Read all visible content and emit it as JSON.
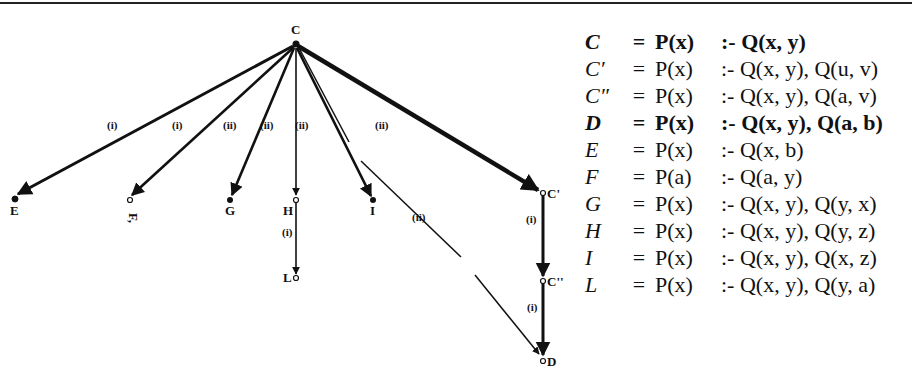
{
  "graph": {
    "root": {
      "id": "C",
      "label": "C",
      "x": 295,
      "y": 45
    },
    "nodes": [
      {
        "id": "E",
        "label": "E",
        "x": 15,
        "y": 199
      },
      {
        "id": "F",
        "label": "F,",
        "x": 130,
        "y": 200
      },
      {
        "id": "G",
        "label": "G",
        "x": 230,
        "y": 200
      },
      {
        "id": "H",
        "label": "H",
        "x": 296,
        "y": 200
      },
      {
        "id": "I",
        "label": "I",
        "x": 373,
        "y": 200
      },
      {
        "id": "L",
        "label": "L",
        "x": 296,
        "y": 278
      },
      {
        "id": "C1",
        "label": "C'",
        "x": 543,
        "y": 193
      },
      {
        "id": "C2",
        "label": "C''",
        "x": 543,
        "y": 281
      },
      {
        "id": "D",
        "label": "D",
        "x": 543,
        "y": 360
      }
    ],
    "edges": [
      {
        "from": "C",
        "to": "E",
        "label": "(i)"
      },
      {
        "from": "C",
        "to": "F",
        "label": "(i)"
      },
      {
        "from": "C",
        "to": "G",
        "label": "(ii)"
      },
      {
        "from": "C",
        "to": "H",
        "label": "(ii)"
      },
      {
        "from": "C",
        "to": "I",
        "label": "(ii)"
      },
      {
        "from": "C",
        "to": "C1",
        "label": "(ii)"
      },
      {
        "from": "C",
        "to": "D",
        "label": "(ii)"
      },
      {
        "from": "H",
        "to": "L",
        "label": "(i)"
      },
      {
        "from": "C1",
        "to": "C2",
        "label": "(i)"
      },
      {
        "from": "C2",
        "to": "D",
        "label": "(i)"
      }
    ]
  },
  "definitions": [
    {
      "name": "C",
      "eq": "=",
      "head": "P(x)",
      "body": ":- Q(x, y)",
      "bold": true
    },
    {
      "name": "C′",
      "eq": "=",
      "head": "P(x)",
      "body": ":- Q(x, y), Q(u, v)",
      "bold": false
    },
    {
      "name": "C″",
      "eq": "=",
      "head": "P(x)",
      "body": ":- Q(x, y), Q(a, v)",
      "bold": false
    },
    {
      "name": "D",
      "eq": "=",
      "head": "P(x)",
      "body": ":- Q(x, y), Q(a, b)",
      "bold": true
    },
    {
      "name": "E",
      "eq": "=",
      "head": "P(x)",
      "body": ":- Q(x, b)",
      "bold": false
    },
    {
      "name": "F",
      "eq": "=",
      "head": "P(a)",
      "body": ":- Q(a, y)",
      "bold": false
    },
    {
      "name": "G",
      "eq": "=",
      "head": "P(x)",
      "body": ":- Q(x, y), Q(y, x)",
      "bold": false
    },
    {
      "name": "H",
      "eq": "=",
      "head": "P(x)",
      "body": ":- Q(x, y), Q(y, z)",
      "bold": false
    },
    {
      "name": "I",
      "eq": "=",
      "head": "P(x)",
      "body": ":- Q(x, y), Q(x, z)",
      "bold": false
    },
    {
      "name": "L",
      "eq": "=",
      "head": "P(x)",
      "body": ":- Q(x, y), Q(y, a)",
      "bold": false
    }
  ]
}
